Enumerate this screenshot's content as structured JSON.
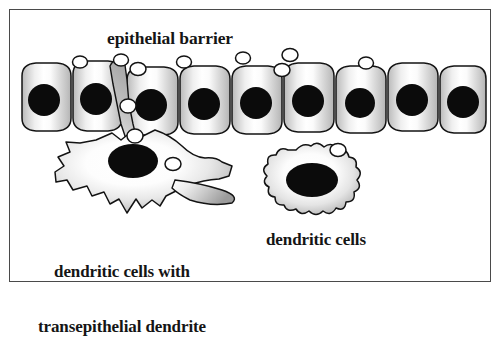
{
  "figure": {
    "title": "epithelial barrier",
    "type": "diagram",
    "background_color": "#ffffff",
    "frame_color": "#4a4a4a",
    "ink_color": "#151515"
  },
  "labels": {
    "epithelial_barrier": "epithelial barrier",
    "dendritic_cells_with_transepithelial_dendrite_line1": "dendritic cells with",
    "dendritic_cells_with_transepithelial_dendrite_line2": "transepithelial dendrite",
    "dendritic_cells": "dendritic cells"
  },
  "elements": {
    "epithelial_cell_count": 9,
    "epithelial_cell_nucleus_color": "#0b0b0b",
    "epithelial_cell_fill": "gradient-gray-white-gray",
    "bacteria_count": 9,
    "bacteria_fill": "#ffffff",
    "dendritic_cell_count": 2,
    "dendritic_cell_left_name": "dendritic cell with transepithelial dendrite",
    "dendritic_cell_right_name": "dendritic cell",
    "dendrite_description": "transepithelial dendrite extending between two epithelial cells into the lumen"
  }
}
